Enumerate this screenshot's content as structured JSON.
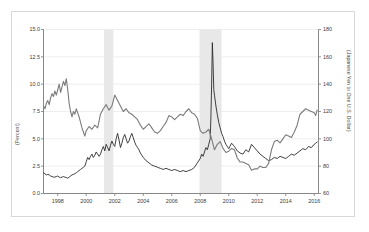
{
  "figure": {
    "background_color": "#ffffff",
    "frame_color": "#d8d8d8",
    "axis_color": "#7a7a7a",
    "grid_color": "#e6e6e6",
    "recession_band_color": "#e8e8e8"
  },
  "chart_data": {
    "type": "line",
    "title": "",
    "xlabel": "",
    "ylabel": "(Percent)",
    "y2label": "(Japanese Yen to One U.S. Dollar)",
    "grid": true,
    "legend": "none",
    "xlim": [
      1997.0,
      2016.3
    ],
    "ylim": [
      0.0,
      15.0
    ],
    "y2lim": [
      60,
      180
    ],
    "xticks": [
      1998,
      2000,
      2002,
      2004,
      2006,
      2008,
      2010,
      2012,
      2014,
      2016
    ],
    "xtick_labels": [
      "1998",
      "2000",
      "2002",
      "2004",
      "2006",
      "2008",
      "2010",
      "2012",
      "2014",
      "2016"
    ],
    "yticks": [
      0.0,
      2.5,
      5.0,
      7.5,
      10.0,
      12.5,
      15.0
    ],
    "ytick_labels": [
      "0.0",
      "2.5",
      "5.0",
      "7.5",
      "10.0",
      "12.5",
      "15.0"
    ],
    "y2ticks": [
      60,
      80,
      100,
      120,
      140,
      160,
      180
    ],
    "y2tick_labels": [
      "60",
      "80",
      "100",
      "120",
      "140",
      "160",
      "180"
    ],
    "shaded_regions": [
      {
        "name": "recession-2001",
        "start": 2001.25,
        "end": 2001.9
      },
      {
        "name": "recession-2008",
        "start": 2007.95,
        "end": 2009.5
      }
    ],
    "series": [
      {
        "name": "percent-series",
        "axis": "left",
        "color": "#2b2b2b",
        "width": 0.9,
        "x": [
          1997.0,
          1997.1,
          1997.2,
          1997.3,
          1997.4,
          1997.5,
          1997.6,
          1997.7,
          1997.8,
          1997.9,
          1998.0,
          1998.1,
          1998.2,
          1998.3,
          1998.4,
          1998.5,
          1998.6,
          1998.7,
          1998.8,
          1998.9,
          1999.0,
          1999.1,
          1999.2,
          1999.3,
          1999.4,
          1999.5,
          1999.6,
          1999.7,
          1999.8,
          1999.9,
          2000.0,
          2000.1,
          2000.2,
          2000.3,
          2000.4,
          2000.5,
          2000.6,
          2000.7,
          2000.8,
          2000.9,
          2001.0,
          2001.1,
          2001.2,
          2001.3,
          2001.4,
          2001.5,
          2001.6,
          2001.7,
          2001.8,
          2001.9,
          2002.0,
          2002.1,
          2002.2,
          2002.3,
          2002.4,
          2002.5,
          2002.6,
          2002.7,
          2002.8,
          2002.9,
          2003.0,
          2003.1,
          2003.2,
          2003.3,
          2003.4,
          2003.5,
          2003.6,
          2003.7,
          2003.8,
          2003.9,
          2004.0,
          2004.2,
          2004.4,
          2004.6,
          2004.8,
          2005.0,
          2005.2,
          2005.4,
          2005.6,
          2005.8,
          2006.0,
          2006.2,
          2006.4,
          2006.6,
          2006.8,
          2007.0,
          2007.2,
          2007.4,
          2007.6,
          2007.8,
          2008.0,
          2008.1,
          2008.2,
          2008.3,
          2008.4,
          2008.5,
          2008.6,
          2008.7,
          2008.75,
          2008.8,
          2008.85,
          2008.9,
          2008.95,
          2009.0,
          2009.1,
          2009.2,
          2009.3,
          2009.4,
          2009.5,
          2009.6,
          2009.7,
          2009.8,
          2009.9,
          2010.0,
          2010.2,
          2010.4,
          2010.6,
          2010.8,
          2011.0,
          2011.2,
          2011.4,
          2011.6,
          2011.8,
          2012.0,
          2012.2,
          2012.4,
          2012.6,
          2012.8,
          2013.0,
          2013.2,
          2013.4,
          2013.6,
          2013.8,
          2014.0,
          2014.2,
          2014.4,
          2014.6,
          2014.8,
          2015.0,
          2015.2,
          2015.4,
          2015.6,
          2015.8,
          2016.0,
          2016.1,
          2016.2
        ],
        "y": [
          1.9,
          1.8,
          1.7,
          1.75,
          1.7,
          1.6,
          1.55,
          1.5,
          1.5,
          1.55,
          1.6,
          1.5,
          1.45,
          1.5,
          1.55,
          1.5,
          1.45,
          1.4,
          1.5,
          1.6,
          1.7,
          1.75,
          1.8,
          1.9,
          2.0,
          2.1,
          2.2,
          2.3,
          2.4,
          2.5,
          2.9,
          3.3,
          3.1,
          3.4,
          3.6,
          3.3,
          3.5,
          3.8,
          3.6,
          3.4,
          3.6,
          4.0,
          4.3,
          3.9,
          4.5,
          4.2,
          3.9,
          4.4,
          4.8,
          4.5,
          4.3,
          5.0,
          5.5,
          4.9,
          4.2,
          4.6,
          5.1,
          5.4,
          5.0,
          4.6,
          4.8,
          5.2,
          5.5,
          5.1,
          4.7,
          4.4,
          4.2,
          4.0,
          3.7,
          3.5,
          3.3,
          3.0,
          2.8,
          2.6,
          2.5,
          2.4,
          2.3,
          2.2,
          2.3,
          2.2,
          2.1,
          2.2,
          2.1,
          2.0,
          2.1,
          2.0,
          2.1,
          2.2,
          2.4,
          2.8,
          3.2,
          3.6,
          3.4,
          3.8,
          4.2,
          4.0,
          4.5,
          5.0,
          7.0,
          10.0,
          13.8,
          12.0,
          9.5,
          9.0,
          8.0,
          7.2,
          6.5,
          6.0,
          5.5,
          5.2,
          4.8,
          4.5,
          4.3,
          4.1,
          4.6,
          4.3,
          3.9,
          3.7,
          3.6,
          4.0,
          3.8,
          4.5,
          4.2,
          3.9,
          3.6,
          3.4,
          3.2,
          3.0,
          3.1,
          3.3,
          3.2,
          3.4,
          3.3,
          3.2,
          3.4,
          3.6,
          3.5,
          3.7,
          3.9,
          4.1,
          4.0,
          4.3,
          4.2,
          4.5,
          4.6,
          4.7
        ]
      },
      {
        "name": "yen-series",
        "axis": "right",
        "color": "#7b7b7b",
        "width": 1.1,
        "x": [
          1997.0,
          1997.1,
          1997.2,
          1997.3,
          1997.4,
          1997.5,
          1997.6,
          1997.7,
          1997.8,
          1997.9,
          1998.0,
          1998.1,
          1998.2,
          1998.3,
          1998.4,
          1998.5,
          1998.6,
          1998.7,
          1998.8,
          1998.9,
          1999.0,
          1999.1,
          1999.2,
          1999.3,
          1999.4,
          1999.5,
          1999.6,
          1999.7,
          1999.8,
          1999.9,
          2000.0,
          2000.2,
          2000.4,
          2000.6,
          2000.8,
          2001.0,
          2001.2,
          2001.4,
          2001.6,
          2001.8,
          2002.0,
          2002.2,
          2002.4,
          2002.6,
          2002.8,
          2003.0,
          2003.2,
          2003.4,
          2003.6,
          2003.8,
          2004.0,
          2004.2,
          2004.4,
          2004.6,
          2004.8,
          2005.0,
          2005.2,
          2005.4,
          2005.6,
          2005.8,
          2006.0,
          2006.2,
          2006.4,
          2006.6,
          2006.8,
          2007.0,
          2007.2,
          2007.4,
          2007.6,
          2007.8,
          2008.0,
          2008.2,
          2008.4,
          2008.6,
          2008.8,
          2009.0,
          2009.2,
          2009.4,
          2009.6,
          2009.8,
          2010.0,
          2010.2,
          2010.4,
          2010.6,
          2010.8,
          2011.0,
          2011.2,
          2011.4,
          2011.6,
          2011.8,
          2012.0,
          2012.2,
          2012.4,
          2012.6,
          2012.8,
          2013.0,
          2013.2,
          2013.4,
          2013.6,
          2013.8,
          2014.0,
          2014.2,
          2014.4,
          2014.6,
          2014.8,
          2015.0,
          2015.2,
          2015.4,
          2015.6,
          2015.8,
          2016.0,
          2016.1,
          2016.2
        ],
        "y": [
          124,
          122,
          126,
          128,
          125,
          130,
          133,
          131,
          135,
          132,
          136,
          140,
          134,
          138,
          142,
          139,
          144,
          136,
          126,
          120,
          116,
          120,
          118,
          122,
          119,
          116,
          112,
          108,
          105,
          102,
          106,
          109,
          107,
          110,
          108,
          118,
          122,
          125,
          121,
          124,
          132,
          128,
          124,
          120,
          122,
          119,
          118,
          116,
          114,
          110,
          107,
          109,
          111,
          108,
          105,
          104,
          106,
          109,
          112,
          117,
          116,
          114,
          116,
          118,
          117,
          120,
          122,
          119,
          118,
          115,
          106,
          104,
          105,
          107,
          100,
          92,
          96,
          98,
          93,
          90,
          91,
          93,
          92,
          86,
          83,
          83,
          82,
          81,
          77,
          78,
          78,
          80,
          79,
          79,
          82,
          92,
          98,
          99,
          97,
          100,
          103,
          102,
          101,
          105,
          110,
          118,
          120,
          122,
          121,
          120,
          119,
          117,
          121
        ]
      }
    ]
  },
  "axes": {
    "left_title": "(Percent)",
    "right_title": "(Japanese Yen to One U.S. Dollar)"
  }
}
